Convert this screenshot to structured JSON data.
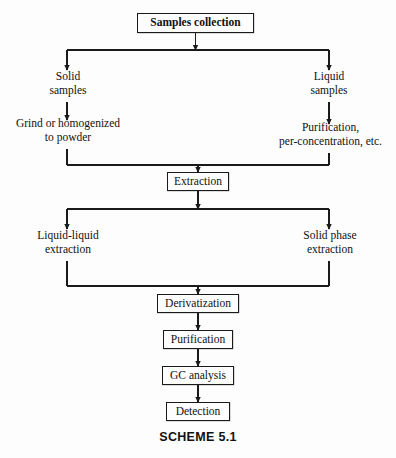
{
  "diagram": {
    "caption": "SCHEME 5.1",
    "colors": {
      "background": "#fdfdfd",
      "line": "#1a1a1a",
      "text": "#111111",
      "box_border": "#1a1a1a"
    },
    "nodes": [
      {
        "id": "samples-collection",
        "label": "Samples collection",
        "style": "boxed-bold",
        "x": 137,
        "y": 13,
        "w": 117,
        "h": 20
      },
      {
        "id": "solid-samples",
        "label": "Solid\nsamples",
        "style": "plain",
        "x": 22,
        "y": 70,
        "w": 92,
        "h": 30
      },
      {
        "id": "liquid-samples",
        "label": "Liquid\nsamples",
        "style": "plain",
        "x": 283,
        "y": 70,
        "w": 92,
        "h": 30
      },
      {
        "id": "grind-homogenize",
        "label": "Grind or homogenized\nto powder",
        "style": "plain",
        "x": 4,
        "y": 117,
        "w": 128,
        "h": 30
      },
      {
        "id": "purification-preconcentration",
        "label": "Purification,\nper-concentration, etc.",
        "style": "plain",
        "x": 265,
        "y": 121,
        "w": 131,
        "h": 30
      },
      {
        "id": "extraction",
        "label": "Extraction",
        "style": "boxed",
        "x": 167,
        "y": 172,
        "w": 62,
        "h": 19
      },
      {
        "id": "liquid-liquid-extraction",
        "label": "Liquid-liquid\nextraction",
        "style": "plain",
        "x": 17,
        "y": 229,
        "w": 102,
        "h": 30
      },
      {
        "id": "solid-phase-extraction",
        "label": "Solid phase\nextraction",
        "style": "plain",
        "x": 281,
        "y": 229,
        "w": 98,
        "h": 30
      },
      {
        "id": "derivatization",
        "label": "Derivatization",
        "style": "boxed",
        "x": 157,
        "y": 294,
        "w": 82,
        "h": 19
      },
      {
        "id": "purification",
        "label": "Purification",
        "style": "boxed",
        "x": 163,
        "y": 330,
        "w": 70,
        "h": 19
      },
      {
        "id": "gc-analysis",
        "label": "GC analysis",
        "style": "boxed",
        "x": 162,
        "y": 366,
        "w": 72,
        "h": 19
      },
      {
        "id": "detection",
        "label": "Detection",
        "style": "boxed",
        "x": 166,
        "y": 402,
        "w": 64,
        "h": 19
      }
    ],
    "caption_y": 430
  }
}
